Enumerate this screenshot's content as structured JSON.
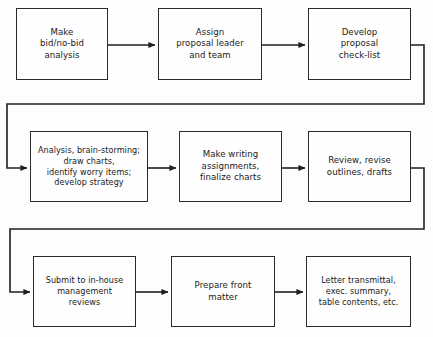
{
  "diagram": {
    "type": "flowchart",
    "orientation": "serpentine-left-to-right",
    "colors": {
      "background": "#fdfdfc",
      "box_border": "#2b2b2b",
      "box_fill": "#fefefe",
      "connector": "#1f1f1f",
      "text": "#1a1a1a"
    },
    "rows": [
      {
        "row_index": 1,
        "nodes": [
          {
            "id": "n1",
            "label": "Make\nbid/no-bid\nanalysis",
            "x": 16,
            "y": 8,
            "w": 92,
            "h": 72
          },
          {
            "id": "n2",
            "label": "Assign\nproposal leader\nand team",
            "x": 158,
            "y": 8,
            "w": 104,
            "h": 72
          },
          {
            "id": "n3",
            "label": "Develop\nproposal\ncheck-list",
            "x": 308,
            "y": 8,
            "w": 103,
            "h": 72
          }
        ]
      },
      {
        "row_index": 2,
        "nodes": [
          {
            "id": "n4",
            "label": "Analysis, brain-storming;\ndraw charts,\nidentify worry items;\ndevelop strategy",
            "x": 30,
            "y": 131,
            "w": 118,
            "h": 71
          },
          {
            "id": "n5",
            "label": "Make writing\nassignments,\nfinalize charts",
            "x": 179,
            "y": 131,
            "w": 103,
            "h": 71
          },
          {
            "id": "n6",
            "label": "Review, revise\noutlines, drafts",
            "x": 308,
            "y": 131,
            "w": 103,
            "h": 71
          }
        ]
      },
      {
        "row_index": 3,
        "nodes": [
          {
            "id": "n7",
            "label": "Submit to in-house\nmanagement\nreviews",
            "x": 33,
            "y": 256,
            "w": 103,
            "h": 71
          },
          {
            "id": "n8",
            "label": "Prepare front\nmatter",
            "x": 171,
            "y": 256,
            "w": 104,
            "h": 71
          },
          {
            "id": "n9",
            "label": "Letter transmittal,\nexec. summary,\ntable contents, etc.",
            "x": 306,
            "y": 256,
            "w": 105,
            "h": 71
          }
        ]
      }
    ],
    "connectors": [
      {
        "id": "c1",
        "from": "n1",
        "to": "n2",
        "kind": "straight-arrow",
        "y": 45
      },
      {
        "id": "c2",
        "from": "n2",
        "to": "n3",
        "kind": "straight-arrow",
        "y": 45
      },
      {
        "id": "c3",
        "from": "n3",
        "to": "n4",
        "kind": "wrap-right-down-left-arrow"
      },
      {
        "id": "c4",
        "from": "n4",
        "to": "n5",
        "kind": "straight-arrow",
        "y": 168
      },
      {
        "id": "c5",
        "from": "n5",
        "to": "n6",
        "kind": "straight-arrow",
        "y": 168
      },
      {
        "id": "c6",
        "from": "n6",
        "to": "n7",
        "kind": "wrap-right-down-left-arrow"
      },
      {
        "id": "c7",
        "from": "n7",
        "to": "n8",
        "kind": "straight-arrow",
        "y": 292
      },
      {
        "id": "c8",
        "from": "n8",
        "to": "n9",
        "kind": "straight-arrow",
        "y": 292
      }
    ]
  }
}
